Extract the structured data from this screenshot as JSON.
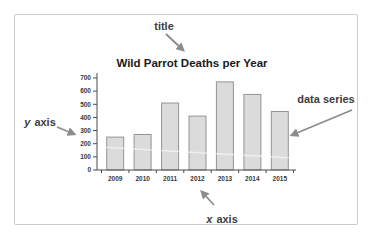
{
  "frame": {
    "border_color": "#cccccc",
    "background": "#ffffff"
  },
  "chart_data": {
    "type": "bar",
    "title": "Wild Parrot Deaths per Year",
    "categories": [
      "2009",
      "2010",
      "2011",
      "2012",
      "2013",
      "2014",
      "2015"
    ],
    "values": [
      250,
      270,
      510,
      410,
      670,
      575,
      445
    ],
    "xlabel": "",
    "ylabel": "",
    "ylim": [
      0,
      700
    ],
    "yticks": [
      0,
      100,
      200,
      300,
      400,
      500,
      600,
      700
    ],
    "grid": false,
    "legend": "none",
    "colors": {
      "bar_fill": "#dbdbdb",
      "bar_stroke": "#949494",
      "axis": "#4a4a4a",
      "tick_label": "#3a3a3a",
      "title": "#1a1a1a"
    }
  },
  "annotations": {
    "arrow_color": "#8c8c8c",
    "text_color": "#3d3d3d",
    "title_label": "title",
    "y_axis_italic": "y",
    "y_axis_label": " axis",
    "x_axis_italic": "x",
    "x_axis_label": " axis",
    "data_series_label": "data series"
  }
}
